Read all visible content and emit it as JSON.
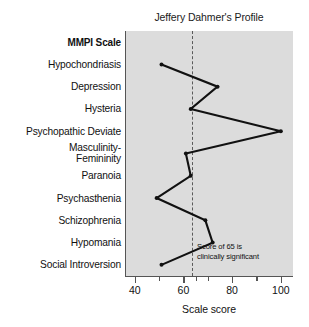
{
  "chart_data": {
    "type": "line",
    "title": "Jeffery Dahmer's Profile",
    "xlabel": "Scale score",
    "ylabel": "MMPI Scale",
    "orientation": "horizontal",
    "categories": [
      "Hypochondriasis",
      "Depression",
      "Hysteria",
      "Psychopathic Deviate",
      "Masculinity-Femininity",
      "Paranoia",
      "Psychasthenia",
      "Schizophrenia",
      "Hypomania",
      "Social Introversion"
    ],
    "values": [
      51,
      74,
      63,
      100,
      61,
      63,
      49,
      69,
      72,
      51
    ],
    "xlim": [
      36,
      105
    ],
    "xticks": [
      40,
      60,
      80,
      100
    ],
    "xtick_labels": [
      "40",
      "60",
      "80",
      "100"
    ],
    "xminor_ticks": [
      50,
      65,
      70,
      90
    ],
    "grid": false,
    "legend": null,
    "reference_line": {
      "value": 65,
      "style": "dashed",
      "label_line1": "Score of 65 is",
      "label_line2": "clinically significant"
    },
    "marker": "circle",
    "line_color": "#111111",
    "plot_background": "#dcdcdc"
  },
  "chart": {
    "title": "Jeffery Dahmer's Profile",
    "category_header": "MMPI Scale",
    "axis_title": "Scale score",
    "annotation_line1": "Score of 65 is",
    "annotation_line2": "clinically significant",
    "categories": [
      {
        "label": "Hypochondriasis",
        "value": 51
      },
      {
        "label": "Depression",
        "value": 74
      },
      {
        "label": "Hysteria",
        "value": 63
      },
      {
        "label": "Psychopathic Deviate",
        "value": 100
      },
      {
        "label": "Masculinity-",
        "label2": "Femininity",
        "value": 61
      },
      {
        "label": "Paranoia",
        "value": 63
      },
      {
        "label": "Psychasthenia",
        "value": 49
      },
      {
        "label": "Schizophrenia",
        "value": 69
      },
      {
        "label": "Hypomania",
        "value": 72
      },
      {
        "label": "Social Introversion",
        "value": 51
      }
    ],
    "xticks": [
      "40",
      "60",
      "80",
      "100"
    ]
  }
}
